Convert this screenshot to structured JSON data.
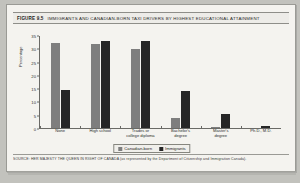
{
  "figure": {
    "number": "FIGURE 9.5",
    "title": "IMMIGRANTS AND CANADIAN-BORN TAXI DRIVERS BY HIGHEST EDUCATIONAL ATTAINMENT",
    "source": "SOURCE: HER MAJESTY THE QUEEN IN RIGHT OF CANADA (as represented by the Department of Citizenship and Immigration Canada)."
  },
  "colors": {
    "canadian_born": "#7e7e7e",
    "immigrants": "#262626",
    "card_background": "#f4f3ef",
    "page_background": "#c2c2bd",
    "axis": "#6a6a66"
  },
  "chart_data": {
    "type": "bar",
    "title": "IMMIGRANTS AND CANADIAN-BORN TAXI DRIVERS BY HIGHEST EDUCATIONAL ATTAINMENT",
    "xlabel": "",
    "ylabel": "Percentage",
    "ylim": [
      0,
      35
    ],
    "yticks": [
      0,
      5,
      10,
      15,
      20,
      25,
      30,
      35
    ],
    "ytick_labels": [
      "0",
      "5",
      "10",
      "15",
      "20",
      "25",
      "30",
      "35"
    ],
    "grid": false,
    "legend_position": "bottom",
    "categories": [
      "None",
      "High school",
      "Trades or\ncollege diploma",
      "Bachelor's\ndegree",
      "Master's\ndegree",
      "Ph.D., M.D."
    ],
    "category_lines": [
      [
        "None"
      ],
      [
        "High school"
      ],
      [
        "Trades or",
        "college diploma"
      ],
      [
        "Bachelor's",
        "degree"
      ],
      [
        "Master's",
        "degree"
      ],
      [
        "Ph.D., M.D."
      ]
    ],
    "series": [
      {
        "name": "Canadian-born",
        "color": "#7e7e7e",
        "values": [
          32.5,
          32,
          30,
          4,
          0.5,
          0
        ]
      },
      {
        "name": "Immigrants",
        "color": "#262626",
        "values": [
          14.5,
          33,
          33,
          14,
          5.5,
          0.8
        ]
      }
    ]
  }
}
